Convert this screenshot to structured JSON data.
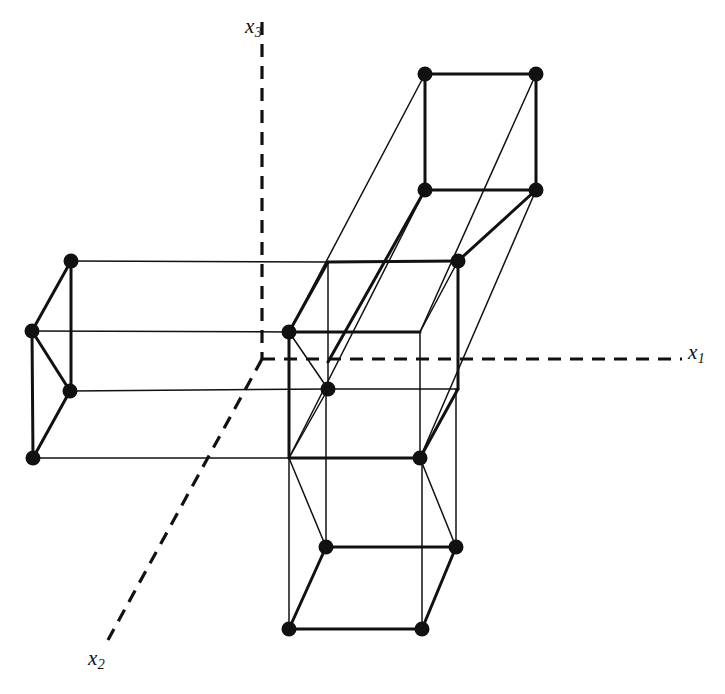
{
  "figure": {
    "kind": "3d-lattice-diagram",
    "background_color": "#ffffff",
    "line_color": "#111111",
    "node_color": "#111111",
    "width": 725,
    "height": 694
  },
  "axes": {
    "labels": {
      "x1": {
        "base": "x",
        "sub": "1"
      },
      "x2": {
        "base": "x",
        "sub": "2"
      },
      "x3": {
        "base": "x",
        "sub": "3"
      }
    },
    "style": "dashed",
    "origin": {
      "x": 262,
      "y": 359
    },
    "lines": [
      {
        "name": "x3-axis",
        "x1": 262,
        "y1": 22,
        "x2": 262,
        "y2": 359
      },
      {
        "name": "x1-axis",
        "x1": 262,
        "y1": 359,
        "x2": 682,
        "y2": 359
      },
      {
        "name": "x2-axis",
        "x1": 262,
        "y1": 359,
        "x2": 108,
        "y2": 640
      }
    ]
  },
  "chart_data": {
    "type": "diagram",
    "title": "",
    "projection": {
      "depth_dx": 39,
      "depth_dy": -70
    },
    "blocks": [
      {
        "name": "central-cell",
        "front_face": {
          "left": 289,
          "right": 420,
          "top": 332,
          "bottom": 458
        },
        "node_count": 3
      },
      {
        "name": "left-arm-cell",
        "front_face": {
          "left": 33,
          "right": 289,
          "top": 331,
          "bottom": 458
        },
        "node_count": 4
      },
      {
        "name": "upper-right-arm-cell",
        "front_face": {
          "left": 425,
          "right": 536,
          "top": 74,
          "bottom": 190
        },
        "node_count": 4
      },
      {
        "name": "lower-arm-cell",
        "front_face": {
          "left": 289,
          "right": 422,
          "top": 547,
          "bottom": 629
        },
        "node_count": 5
      }
    ],
    "lattice_points": [
      {
        "id": "p1",
        "x": 425,
        "y": 74
      },
      {
        "id": "p2",
        "x": 536,
        "y": 74
      },
      {
        "id": "p3",
        "x": 425,
        "y": 190
      },
      {
        "id": "p4",
        "x": 536,
        "y": 190
      },
      {
        "id": "p5",
        "x": 71,
        "y": 261
      },
      {
        "id": "p6",
        "x": 458,
        "y": 261
      },
      {
        "id": "p7",
        "x": 32,
        "y": 331
      },
      {
        "id": "p8",
        "x": 289,
        "y": 332
      },
      {
        "id": "p9",
        "x": 70,
        "y": 391
      },
      {
        "id": "p10",
        "x": 328,
        "y": 389
      },
      {
        "id": "p11",
        "x": 33,
        "y": 458
      },
      {
        "id": "p12",
        "x": 420,
        "y": 458
      },
      {
        "id": "p13",
        "x": 326,
        "y": 547
      },
      {
        "id": "p14",
        "x": 456,
        "y": 547
      },
      {
        "id": "p15",
        "x": 289,
        "y": 629
      },
      {
        "id": "p16",
        "x": 422,
        "y": 629
      }
    ],
    "edges_thick": [
      [
        425,
        74,
        536,
        74
      ],
      [
        425,
        74,
        425,
        190
      ],
      [
        536,
        74,
        536,
        190
      ],
      [
        425,
        190,
        536,
        190
      ],
      [
        71,
        261,
        32,
        331
      ],
      [
        71,
        261,
        71,
        391
      ],
      [
        32,
        331,
        33,
        458
      ],
      [
        70,
        391,
        33,
        458
      ],
      [
        32,
        331,
        70,
        391
      ],
      [
        289,
        332,
        289,
        458
      ],
      [
        289,
        332,
        328,
        262
      ],
      [
        458,
        261,
        458,
        389
      ],
      [
        289,
        332,
        420,
        332
      ],
      [
        289,
        458,
        420,
        458
      ],
      [
        420,
        458,
        458,
        389
      ],
      [
        328,
        262,
        458,
        261
      ],
      [
        326,
        547,
        456,
        547
      ],
      [
        326,
        547,
        289,
        629
      ],
      [
        456,
        547,
        422,
        629
      ],
      [
        289,
        629,
        422,
        629
      ],
      [
        425,
        190,
        328,
        362
      ],
      [
        536,
        190,
        458,
        261
      ]
    ],
    "edges_thin": [
      [
        71,
        261,
        328,
        262
      ],
      [
        71,
        391,
        328,
        389
      ],
      [
        33,
        458,
        420,
        458
      ],
      [
        32,
        331,
        289,
        332
      ],
      [
        420,
        332,
        420,
        458
      ],
      [
        420,
        332,
        458,
        261
      ],
      [
        328,
        262,
        328,
        389
      ],
      [
        328,
        389,
        420,
        389
      ],
      [
        420,
        389,
        458,
        389
      ],
      [
        328,
        389,
        289,
        458
      ],
      [
        289,
        332,
        328,
        389
      ],
      [
        425,
        74,
        289,
        332
      ],
      [
        536,
        74,
        420,
        332
      ],
      [
        425,
        190,
        289,
        458
      ],
      [
        536,
        190,
        420,
        458
      ],
      [
        326,
        547,
        326,
        389
      ],
      [
        456,
        547,
        456,
        389
      ],
      [
        289,
        629,
        289,
        458
      ],
      [
        422,
        629,
        422,
        458
      ],
      [
        289,
        458,
        326,
        547
      ],
      [
        420,
        458,
        456,
        547
      ]
    ]
  }
}
